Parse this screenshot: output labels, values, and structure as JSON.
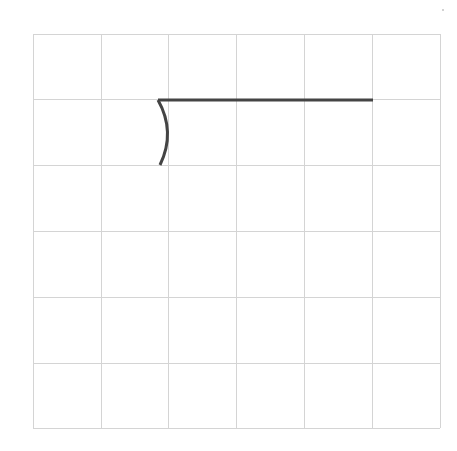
{
  "canvas": {
    "width": 457,
    "height": 451,
    "background": "#ffffff"
  },
  "grid": {
    "rows": 6,
    "cols": 6,
    "x_lines": [
      33,
      101,
      168,
      236,
      304,
      372,
      440
    ],
    "y_lines": [
      34,
      99,
      165,
      231,
      297,
      363,
      428
    ],
    "line_color": "#d4d4d4",
    "line_width": 1
  },
  "strokes": [
    {
      "name": "curved-stroke",
      "path": "M 158 100 Q 176 132 160 165",
      "color": "#444444",
      "width": 3
    },
    {
      "name": "horizontal-stroke",
      "path": "M 158 100 L 373 100",
      "color": "#444444",
      "width": 3
    }
  ],
  "marker_dot": {
    "cx": 443,
    "cy": 10,
    "r": 0.8,
    "color": "#999999"
  }
}
